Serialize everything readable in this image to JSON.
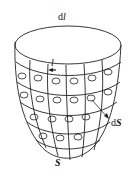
{
  "diagram": {
    "labels": {
      "top_d": "d",
      "top_l": "l",
      "loop_label": "l",
      "ds_d": "d",
      "ds_S": "S",
      "surface": "S"
    },
    "colors": {
      "stroke": "#222222",
      "background": "#ffffff"
    }
  }
}
